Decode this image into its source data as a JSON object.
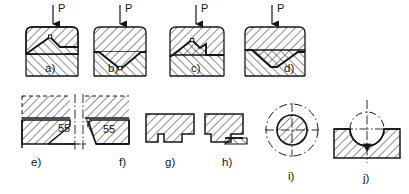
{
  "figure": {
    "background_color": "#ffffff",
    "line_color": "#161616",
    "hatch_color": "#262626",
    "width": 409,
    "height": 194
  },
  "load_labels": {
    "a": "P",
    "b": "P",
    "c": "P",
    "d": "P"
  },
  "dimensions": {
    "angle_e": "55",
    "angle_f": "55"
  },
  "panels": [
    {
      "id": "a",
      "label": "a)",
      "row": "top",
      "description": "symmetric die with raised central V apex and flat shoulders, load P applied at center"
    },
    {
      "id": "b",
      "label": "b)",
      "row": "top",
      "description": "die with downward V notch reaching a small square relief at the apex, load P at center"
    },
    {
      "id": "c",
      "label": "c)",
      "row": "top",
      "description": "asymmetric die, inclined left flank rising to a central peak with stepped right flank, load P"
    },
    {
      "id": "d",
      "label": "d)",
      "row": "top",
      "description": "wide die with deep V groove offset, bold interface line, load P"
    },
    {
      "id": "e",
      "label": "e)",
      "row": "bottom",
      "description": "corner detail, tapered insert with 55 degree flank angle, centerline at right"
    },
    {
      "id": "f",
      "label": "f)",
      "row": "bottom",
      "description": "mirrored corner detail, tapered insert with 55 degree flank angle, centerline at left"
    },
    {
      "id": "g",
      "label": "g)",
      "row": "bottom",
      "description": "stepped block profile with single rebate on lower left"
    },
    {
      "id": "h",
      "label": "h)",
      "row": "bottom",
      "description": "stepped block profile with rebate plus thin extended lip to the right"
    },
    {
      "id": "i",
      "label": "i)",
      "row": "bottom",
      "description": "hatched circular punch with cross centerlines and dash-dot outer reference circle"
    },
    {
      "id": "j",
      "label": "j)",
      "row": "bottom",
      "description": "circular punch seated in matching concave die cavity with centerlines"
    }
  ],
  "panel_labels": {
    "a": "a)",
    "b": "b)",
    "c": "c)",
    "d": "d)",
    "e": "e)",
    "f": "f)",
    "g": "g)",
    "h": "h)",
    "i": "i)",
    "j": "j)"
  }
}
